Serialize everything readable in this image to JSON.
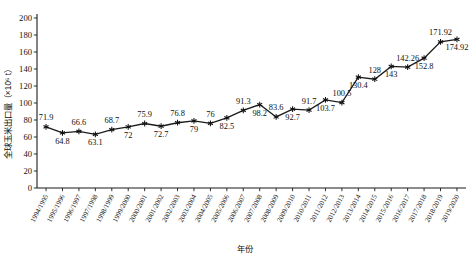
{
  "chart_data": {
    "type": "line",
    "title": "",
    "xlabel": "年份",
    "ylabel": "全球玉米出口量（×10⁶ t）",
    "ylim": [
      0,
      200
    ],
    "yticks": [
      0,
      20,
      40,
      60,
      80,
      100,
      120,
      140,
      160,
      180,
      200
    ],
    "grid": false,
    "legend": "none",
    "marker": "asterisk",
    "line_color": "#1b1b1b",
    "categories": [
      "1994/1995",
      "1995/1996",
      "1996/1997",
      "1997/1998",
      "1998/1999",
      "1999/2000",
      "2000/2001",
      "2001/2002",
      "2002/2003",
      "2003/2004",
      "2004/2005",
      "2005/2006",
      "2006/2007",
      "2007/2008",
      "2008/2009",
      "2009/2010",
      "2010/2011",
      "2011/2012",
      "2012/2013",
      "2013/2014",
      "2014/2015",
      "2015/2016",
      "2016/2017",
      "2017/2018",
      "2018/2019",
      "2019/2020"
    ],
    "values": [
      71.9,
      64.8,
      66.6,
      63.1,
      68.7,
      72,
      75.9,
      72.7,
      76.8,
      79,
      76,
      82.5,
      91.3,
      98.2,
      83.6,
      92.7,
      91.7,
      103.7,
      100.5,
      130.4,
      128,
      143,
      142.26,
      152.8,
      171.92,
      174.92
    ],
    "value_labels": [
      "71.9",
      "64.8",
      "66.6",
      "63.1",
      "68.7",
      "72",
      "75.9",
      "72.7",
      "76.8",
      "79",
      "76",
      "82.5",
      "91.3",
      "98.2",
      "83.6",
      "92.7",
      "91.7",
      "103.7",
      "100.5",
      "130.4",
      "128",
      "143",
      "142.26",
      "152.8",
      "171.92",
      "174.92"
    ],
    "label_positions": [
      "above",
      "below",
      "above",
      "below",
      "above",
      "below",
      "above",
      "below",
      "above",
      "below",
      "above",
      "below",
      "above",
      "below",
      "above",
      "below",
      "above",
      "below",
      "above",
      "below",
      "above",
      "below",
      "above",
      "below",
      "above",
      "below"
    ]
  }
}
